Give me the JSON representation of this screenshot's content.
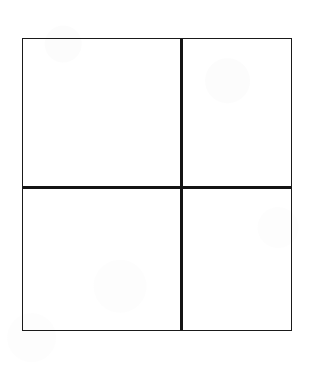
{
  "figure": {
    "visible_text": "",
    "background_color": "#ffffff",
    "line_color": "#1a1a1a",
    "canvas": {
      "width_px": 316,
      "height_px": 367
    },
    "frame": {
      "left_px": 22,
      "top_px": 38,
      "width_px": 270,
      "height_px": 293,
      "border_width_px": 1.5,
      "border_color": "#1a1a1a"
    },
    "dividers": {
      "vertical": {
        "x_px": 157,
        "thickness_px": 3,
        "color": "#141414"
      },
      "horizontal": {
        "y_px": 147,
        "thickness_px": 3,
        "color": "#141414"
      }
    },
    "cells": [
      {
        "name": "top-left",
        "label": "",
        "left_px": 0,
        "top_px": 0,
        "width_px": 135,
        "height_px": 147
      },
      {
        "name": "top-right",
        "label": "",
        "left_px": 160,
        "top_px": 0,
        "width_px": 108,
        "height_px": 147
      },
      {
        "name": "bottom-left",
        "label": "",
        "left_px": 0,
        "top_px": 150,
        "width_px": 135,
        "height_px": 141
      },
      {
        "name": "bottom-right",
        "label": "",
        "left_px": 160,
        "top_px": 150,
        "width_px": 108,
        "height_px": 141
      }
    ]
  }
}
